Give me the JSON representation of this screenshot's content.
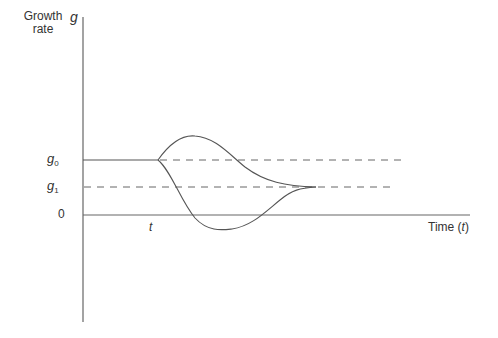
{
  "diagram": {
    "y_axis_label_line1": "Growth",
    "y_axis_label_line2": "rate",
    "y_axis_symbol": "g",
    "x_axis_label_prefix": "Time (",
    "x_axis_label_var": "t",
    "x_axis_label_suffix": ")",
    "level_g0": {
      "base": "g",
      "sub": "0"
    },
    "level_g1": {
      "base": "g",
      "sub": "1"
    },
    "zero_label": "0",
    "time_marker": "t",
    "curves": [
      {
        "name": "overshoot-path",
        "description": "rises above g0 then declines to converge at g1"
      },
      {
        "name": "undershoot-path",
        "description": "falls below 0 then rises to converge at g1"
      }
    ],
    "colors": {
      "line": "#555555",
      "text": "#333333"
    }
  }
}
